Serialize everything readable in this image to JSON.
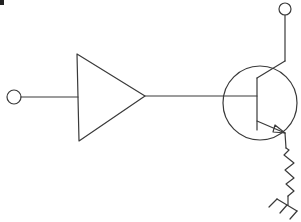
{
  "diagram": {
    "type": "circuit-schematic",
    "stroke_color": "#3a3a3a",
    "background_color": "#ffffff",
    "components": [
      {
        "id": "input-terminal",
        "kind": "terminal",
        "label": ""
      },
      {
        "id": "amplifier",
        "kind": "amplifier-triangle",
        "label": ""
      },
      {
        "id": "transistor",
        "kind": "npn-bjt",
        "label": ""
      },
      {
        "id": "collector-terminal",
        "kind": "terminal",
        "label": ""
      },
      {
        "id": "emitter-resistor",
        "kind": "resistor",
        "label": ""
      },
      {
        "id": "ground",
        "kind": "chassis-ground",
        "label": ""
      }
    ],
    "connections": [
      [
        "input-terminal",
        "amplifier.input"
      ],
      [
        "amplifier.output",
        "transistor.base"
      ],
      [
        "transistor.collector",
        "collector-terminal"
      ],
      [
        "transistor.emitter",
        "emitter-resistor"
      ],
      [
        "emitter-resistor",
        "ground"
      ]
    ]
  }
}
